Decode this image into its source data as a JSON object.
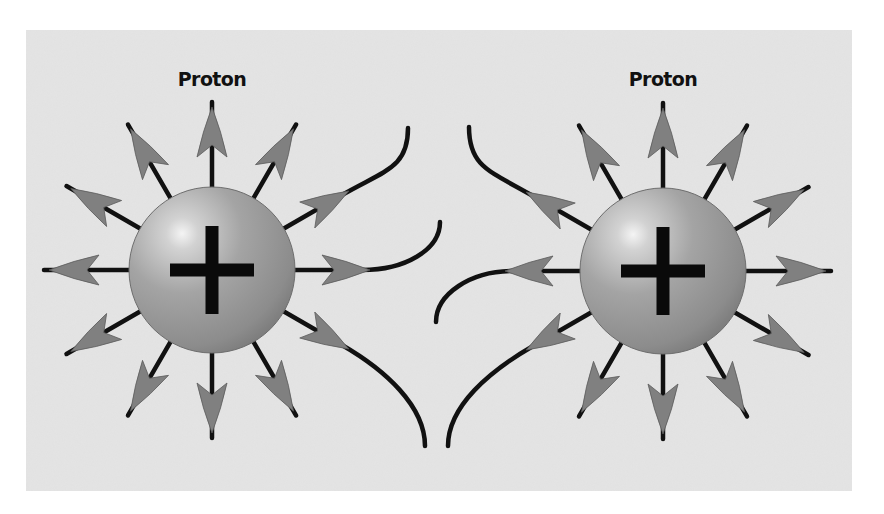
{
  "figure": {
    "background_color": "#e4e4e4",
    "panel": {
      "x": 26,
      "y": 30,
      "width": 826,
      "height": 461
    },
    "line_color": "#111111",
    "arrow_color": "#808080",
    "sphere_color": "#9a9a9a"
  },
  "particles": [
    {
      "id": "left",
      "label": "Proton",
      "charge_symbol": "+",
      "cx": 212,
      "cy": 270,
      "r": 83
    },
    {
      "id": "right",
      "label": "Proton",
      "charge_symbol": "+",
      "cx": 663,
      "cy": 271,
      "r": 83
    }
  ],
  "field_lines": {
    "left": {
      "straight_angles_deg": [
        60,
        90,
        120,
        150,
        180,
        210,
        240,
        270,
        300
      ],
      "curved": [
        {
          "angle_deg": 30,
          "bend_to": [
            408,
            128
          ]
        },
        {
          "angle_deg": 0,
          "bend_to": [
            440,
            222
          ]
        },
        {
          "angle_deg": -30,
          "bend_to": [
            425,
            446
          ]
        }
      ]
    },
    "right": {
      "straight_angles_deg": [
        0,
        30,
        60,
        90,
        120,
        240,
        270,
        300,
        330
      ],
      "curved": [
        {
          "angle_deg": 150,
          "bend_to": [
            469,
            127
          ]
        },
        {
          "angle_deg": 180,
          "bend_to": [
            436,
            322
          ]
        },
        {
          "angle_deg": 210,
          "bend_to": [
            448,
            446
          ]
        }
      ]
    }
  }
}
